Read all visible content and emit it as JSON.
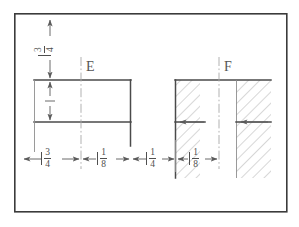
{
  "drawing": {
    "title": "Engineering dimension detail drawing",
    "frame": {
      "name": "border-frame",
      "x": 14,
      "y": 13,
      "width": 273,
      "height": 199,
      "color": "#3b3b3b"
    },
    "colors": {
      "object_line": "#4a4a4a",
      "center_line": "#a8a8a8",
      "dimension_line": "#5a5a5a",
      "hatch": "#b0b0b0",
      "frame": "#3b3b3b",
      "text": "#4f4f4f",
      "background": "#ffffff"
    },
    "part_labels": [
      {
        "id": "E",
        "text": "E",
        "x": 86,
        "y": 62
      },
      {
        "id": "F",
        "text": "F",
        "x": 224,
        "y": 62
      }
    ],
    "vertical_dimension": {
      "name": "top-vertical-dimension",
      "numerator": "3",
      "denominator": "4",
      "label": "3/4",
      "orientation": "vertical",
      "x": 40,
      "y": 52,
      "line_x": 50,
      "line_top": 18,
      "line_bottom": 80
    },
    "left_vertical_dimension": {
      "name": "left-inner-vertical-dimension",
      "label": "",
      "note": "small unlabeled vertical dimension",
      "line_x": 50,
      "line_top": 80,
      "line_bottom": 122
    },
    "horizontal_dimensions": [
      {
        "id": "dim-3-4",
        "numerator": "3",
        "denominator": "4",
        "label": "3/4",
        "from_x": 22,
        "to_x": 81,
        "y": 159,
        "text_x": 41,
        "text_y": 150
      },
      {
        "id": "dim-1-8-left",
        "numerator": "1",
        "denominator": "8",
        "label": "1/8",
        "from_x": 81,
        "to_x": 131,
        "y": 159,
        "text_x": 97,
        "text_y": 150
      },
      {
        "id": "dim-1-4",
        "numerator": "1",
        "denominator": "4",
        "label": "1/4",
        "from_x": 131,
        "to_x": 176,
        "y": 159,
        "text_x": 145,
        "text_y": 150
      },
      {
        "id": "dim-1-8-right",
        "numerator": "1",
        "denominator": "8",
        "label": "1/8",
        "from_x": 176,
        "to_x": 219,
        "y": 159,
        "text_x": 188,
        "text_y": 150
      }
    ],
    "left_shape": {
      "name": "left-open-rectangle",
      "top_y": 80,
      "bottom_y": 122,
      "left_x": 34,
      "right_x": 131,
      "centerline_x": 81
    },
    "right_shape": {
      "name": "right-hatched-section",
      "top_y": 80,
      "hatch_bottom_y": 178,
      "block_a": {
        "left_x": 175,
        "right_x": 200
      },
      "gap": {
        "left_x": 200,
        "right_x": 236
      },
      "block_b": {
        "left_x": 236,
        "right_x": 271
      },
      "centerline_x": 219,
      "inner_line_y": 122
    }
  }
}
